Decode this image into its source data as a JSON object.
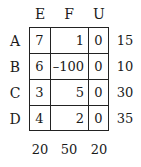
{
  "table": {
    "columns": [
      "E",
      "F",
      "U"
    ],
    "rows": [
      {
        "label": "A",
        "cells": [
          "7",
          "1",
          "0"
        ],
        "supply": "15"
      },
      {
        "label": "B",
        "cells": [
          "6",
          "–100",
          "0"
        ],
        "supply": "10"
      },
      {
        "label": "C",
        "cells": [
          "3",
          "5",
          "0"
        ],
        "supply": "30"
      },
      {
        "label": "D",
        "cells": [
          "4",
          "2",
          "0"
        ],
        "supply": "35"
      }
    ],
    "demand": [
      "20",
      "50",
      "20"
    ]
  }
}
